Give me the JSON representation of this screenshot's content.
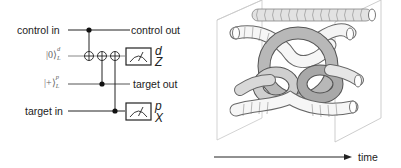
{
  "circuit": {
    "inputs": {
      "control_in": "control in",
      "logical_zero": "|0⟩",
      "logical_zero_sup": "d",
      "logical_zero_sub": "L",
      "logical_plus": "|+⟩",
      "logical_plus_sup": "p",
      "logical_plus_sub": "L",
      "target_in": "target in"
    },
    "outputs": {
      "control_out": "control out",
      "target_out": "target out"
    },
    "measurements": [
      {
        "name": "d",
        "basis": "Z"
      },
      {
        "name": "p",
        "basis": "X"
      }
    ],
    "gates": [
      {
        "type": "CNOT",
        "control": "control",
        "target": "d"
      },
      {
        "type": "CNOT",
        "control": "p",
        "target": "d"
      },
      {
        "type": "CNOT",
        "control": "target",
        "target": "d"
      }
    ]
  },
  "braid": {
    "axis_label": "time",
    "colors": {
      "light": "#f4f4f4",
      "mid": "#bdbdbd",
      "dark": "#8f8f8f",
      "outline": "#555555",
      "frame": "#b0b0b0"
    }
  }
}
